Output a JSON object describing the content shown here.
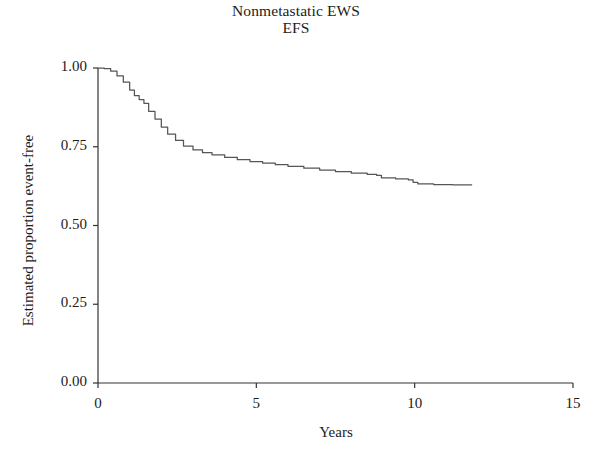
{
  "chart_data": {
    "type": "line",
    "title": "Nonmetastatic EWS",
    "subtitle": "EFS",
    "xlabel": "Years",
    "ylabel": "Estimated proportion event-free",
    "xlim": [
      0,
      15
    ],
    "ylim": [
      0,
      1.0
    ],
    "xticks": [
      0,
      5,
      10,
      15
    ],
    "xtick_labels": [
      "0",
      "5",
      "10",
      "15"
    ],
    "yticks": [
      0.0,
      0.25,
      0.5,
      0.75,
      1.0
    ],
    "ytick_labels": [
      "0.00",
      "0.25",
      "0.50",
      "0.75",
      "1.00"
    ],
    "grid": false,
    "legend": false,
    "line_color": "#555555",
    "axis_color": "#333333",
    "series": [
      {
        "name": "Event-free survival",
        "x": [
          0.0,
          0.2,
          0.4,
          0.6,
          0.8,
          1.0,
          1.15,
          1.3,
          1.45,
          1.6,
          1.8,
          2.0,
          2.2,
          2.45,
          2.7,
          3.0,
          3.3,
          3.6,
          4.0,
          4.4,
          4.8,
          5.2,
          5.6,
          6.0,
          6.5,
          7.0,
          7.5,
          8.0,
          8.5,
          8.8,
          8.95,
          9.4,
          9.8,
          9.95,
          10.1,
          10.6,
          11.2,
          11.8
        ],
        "y": [
          1.0,
          0.998,
          0.99,
          0.975,
          0.955,
          0.93,
          0.912,
          0.9,
          0.888,
          0.862,
          0.838,
          0.812,
          0.79,
          0.77,
          0.752,
          0.74,
          0.731,
          0.724,
          0.716,
          0.709,
          0.703,
          0.698,
          0.693,
          0.688,
          0.682,
          0.676,
          0.671,
          0.666,
          0.662,
          0.659,
          0.651,
          0.648,
          0.645,
          0.637,
          0.632,
          0.63,
          0.629,
          0.629
        ]
      }
    ]
  },
  "axis": {
    "tick_length": 5
  }
}
